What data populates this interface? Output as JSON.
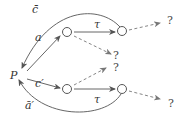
{
  "diagram": {
    "start_node": "P",
    "labels": {
      "c_bar": "c̄",
      "a": "a",
      "tau_top": "τ",
      "c_prime": "c′",
      "tau_bottom": "τ",
      "a_prime_bar": "ā′"
    },
    "unknown": "?",
    "edges": [
      {
        "from": "P",
        "to": "n1",
        "label": "a",
        "style": "solid"
      },
      {
        "from": "n1",
        "to": "n2",
        "label": "τ",
        "style": "solid"
      },
      {
        "from": "n2",
        "to": "P",
        "label": "c̄",
        "style": "solid-curved"
      },
      {
        "from": "n1",
        "to": "?",
        "label": "",
        "style": "dashed"
      },
      {
        "from": "n2",
        "to": "?",
        "label": "",
        "style": "dashed"
      },
      {
        "from": "P",
        "to": "n3",
        "label": "c′",
        "style": "solid"
      },
      {
        "from": "n3",
        "to": "n4",
        "label": "τ",
        "style": "solid"
      },
      {
        "from": "n4",
        "to": "P",
        "label": "ā′",
        "style": "solid-curved"
      },
      {
        "from": "n3",
        "to": "?",
        "label": "",
        "style": "dashed"
      },
      {
        "from": "n4",
        "to": "?",
        "label": "",
        "style": "dashed"
      }
    ]
  }
}
